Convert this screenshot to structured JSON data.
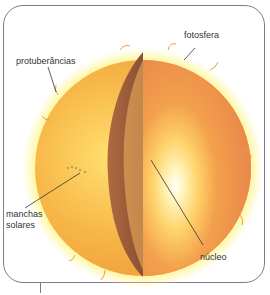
{
  "diagram": {
    "labels": {
      "photosphere": "fotosfera",
      "prominences": "protuberâncias",
      "sunspots_line1": "manchas",
      "sunspots_line2": "solares",
      "core": "núcleo"
    },
    "colors": {
      "frame": "#8a7590",
      "sun_outer": "#f0a040",
      "sun_glow": "#fff27a",
      "cut_face": "#e88a4a",
      "shell_dark": "#9a5a3a",
      "core_light": "#fff6c8",
      "leader_line": "#333333"
    }
  }
}
